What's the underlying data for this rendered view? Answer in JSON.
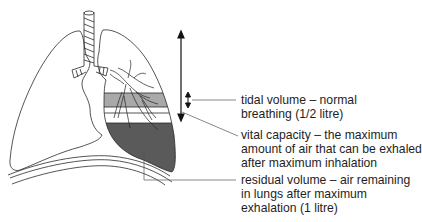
{
  "diagram": {
    "colors": {
      "outline": "#2a2a2a",
      "tidal_band": "#a9a9a9",
      "residual_fill": "#5a5a5a",
      "leader_line": "#555555",
      "text": "#1e1e1e",
      "background": "#ffffff"
    },
    "labels": [
      {
        "id": "tidal-volume",
        "lines": [
          "tidal volume – normal",
          "breathing (1/2 litre)"
        ]
      },
      {
        "id": "vital-capacity",
        "lines": [
          "vital capacity – the maximum",
          "amount of air that can be exhaled",
          "after maximum inhalation"
        ]
      },
      {
        "id": "residual-volume",
        "lines": [
          "residual volume – air remaining",
          "in lungs after maximum",
          "exhalation (1 litre)"
        ]
      }
    ]
  }
}
